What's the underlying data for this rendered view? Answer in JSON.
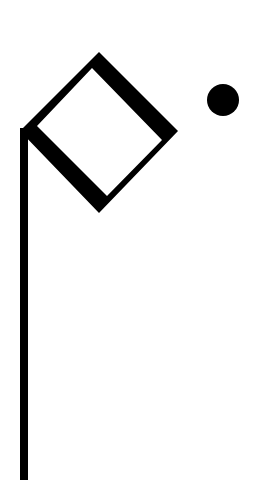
{
  "figure": {
    "colors": {
      "background": "#ffffff",
      "ink": "#000000"
    },
    "pole": {
      "x": 20,
      "y": 128,
      "width": 8,
      "bottom": 480
    },
    "diamond_outer": "99,52 178,131 99,213 20,131",
    "diamond_inner": "92,68 162,140 107,196 37,126",
    "dot": {
      "cx": 223,
      "cy": 100,
      "r": 16
    }
  }
}
